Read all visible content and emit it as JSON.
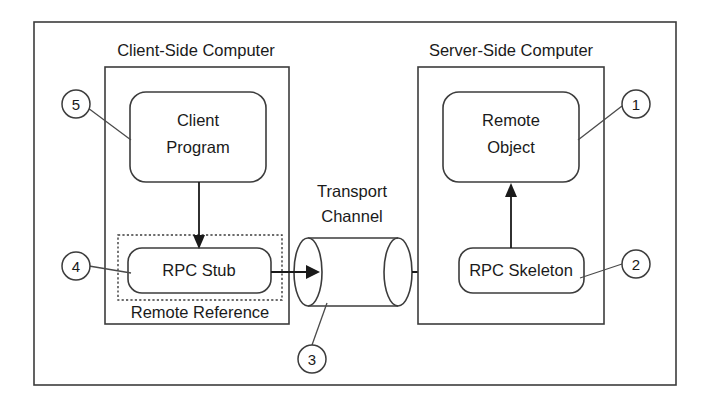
{
  "diagram": {
    "frame": {
      "name": "outer-frame"
    },
    "sections": [
      {
        "id": "client-side",
        "label": "Client-Side Computer"
      },
      {
        "id": "server-side",
        "label": "Server-Side Computer"
      }
    ],
    "nodes": [
      {
        "id": "client-program",
        "label_line1": "Client",
        "label_line2": "Program",
        "shape": "rounded-rect"
      },
      {
        "id": "rpc-stub",
        "label_line1": "RPC Stub",
        "label_line2": "",
        "shape": "rounded-rect"
      },
      {
        "id": "remote-object",
        "label_line1": "Remote",
        "label_line2": "Object",
        "shape": "rounded-rect"
      },
      {
        "id": "rpc-skeleton",
        "label_line1": "RPC Skeleton",
        "label_line2": "",
        "shape": "rounded-rect"
      },
      {
        "id": "transport-channel",
        "label_line1": "Transport",
        "label_line2": "Channel",
        "shape": "cylinder"
      }
    ],
    "groups": [
      {
        "id": "remote-reference",
        "label": "Remote Reference",
        "shape": "dashed-rect"
      }
    ],
    "callouts": [
      {
        "id": "callout-1",
        "number": "1",
        "target": "remote-object"
      },
      {
        "id": "callout-2",
        "number": "2",
        "target": "rpc-skeleton"
      },
      {
        "id": "callout-3",
        "number": "3",
        "target": "transport-channel"
      },
      {
        "id": "callout-4",
        "number": "4",
        "target": "rpc-stub"
      },
      {
        "id": "callout-5",
        "number": "5",
        "target": "client-program"
      }
    ],
    "connections": [
      {
        "id": "conn-client-to-stub",
        "from": "client-program",
        "to": "rpc-stub",
        "arrow": true
      },
      {
        "id": "conn-stub-to-channel",
        "from": "rpc-stub",
        "to": "transport-channel",
        "arrow": true
      },
      {
        "id": "conn-channel-to-skeleton",
        "from": "transport-channel",
        "to": "rpc-skeleton",
        "arrow": true
      },
      {
        "id": "conn-skeleton-to-object",
        "from": "rpc-skeleton",
        "to": "remote-object",
        "arrow": true
      }
    ],
    "colors": {
      "line": "#3c3c3c",
      "arrow": "#1a1a1a",
      "text": "#1a1a1a",
      "background": "#ffffff"
    }
  }
}
